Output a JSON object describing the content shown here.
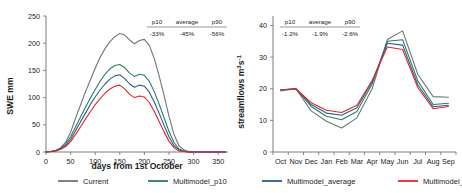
{
  "figure": {
    "background": "#ffffff",
    "colors": {
      "current": "#6b7a76",
      "p10": "#2e7d5b",
      "average": "#2a5d94",
      "p90": "#e8252a",
      "axis": "#6e6e6e",
      "text": "#1b1b1b"
    },
    "legend": {
      "items": [
        {
          "label": "Current",
          "color": "#6b7a76",
          "key": "current"
        },
        {
          "label": "Multimodel_p10",
          "color": "#2e7d5b",
          "key": "p10"
        },
        {
          "label": "Multimodel_average",
          "color": "#2a5d94",
          "key": "average"
        },
        {
          "label": "Multimodel_p90",
          "color": "#e8252a",
          "key": "p90"
        }
      ]
    }
  },
  "chart_data": [
    {
      "id": "swe",
      "type": "line",
      "title": "",
      "xlabel": "days from 1st October",
      "ylabel": "SWE mm",
      "xlim": [
        0,
        370
      ],
      "ylim": [
        0,
        250
      ],
      "xticks": [
        0,
        50,
        100,
        150,
        200,
        250,
        300,
        350
      ],
      "yticks": [
        0,
        50,
        100,
        150,
        200,
        250
      ],
      "grid": false,
      "legend_position": "below-figure",
      "annotation_table": {
        "headers": [
          "p10",
          "average",
          "p90"
        ],
        "values": [
          "-33%",
          "-45%",
          "-56%"
        ]
      },
      "x": [
        0,
        10,
        20,
        30,
        40,
        50,
        60,
        70,
        80,
        90,
        100,
        110,
        120,
        130,
        140,
        150,
        160,
        170,
        180,
        190,
        200,
        210,
        220,
        230,
        240,
        250,
        260,
        270,
        280,
        290,
        300,
        310,
        320,
        340,
        365
      ],
      "series": [
        {
          "name": "Current",
          "color": "#6b7a76",
          "values": [
            0,
            1,
            3,
            8,
            18,
            36,
            62,
            86,
            110,
            132,
            154,
            174,
            190,
            203,
            212,
            218,
            215,
            206,
            199,
            205,
            207,
            196,
            172,
            140,
            104,
            66,
            33,
            12,
            4,
            1,
            0,
            0,
            0,
            0,
            0
          ]
        },
        {
          "name": "Multimodel_p10",
          "color": "#2e7d5b",
          "values": [
            0,
            1,
            3,
            7,
            15,
            28,
            46,
            64,
            82,
            99,
            115,
            130,
            143,
            153,
            159,
            161,
            155,
            145,
            139,
            143,
            141,
            130,
            111,
            88,
            63,
            38,
            18,
            6,
            2,
            0,
            0,
            0,
            0,
            0,
            0
          ]
        },
        {
          "name": "Multimodel_average",
          "color": "#2a5d94",
          "values": [
            0,
            1,
            2,
            6,
            12,
            23,
            39,
            55,
            71,
            87,
            101,
            114,
            125,
            134,
            140,
            142,
            135,
            125,
            119,
            123,
            121,
            110,
            92,
            71,
            49,
            28,
            12,
            4,
            1,
            0,
            0,
            0,
            0,
            0,
            0
          ]
        },
        {
          "name": "Multimodel_p90",
          "color": "#e8252a",
          "values": [
            0,
            1,
            2,
            5,
            10,
            19,
            32,
            46,
            60,
            74,
            87,
            98,
            108,
            116,
            121,
            123,
            116,
            106,
            100,
            103,
            101,
            91,
            75,
            56,
            37,
            20,
            8,
            2,
            1,
            0,
            0,
            0,
            0,
            0,
            0
          ]
        }
      ]
    },
    {
      "id": "streamflows",
      "type": "line",
      "title": "",
      "xlabel": "",
      "ylabel": "streamflows  m3s-1",
      "ylabel_display": "streamflows  m³s⁻¹",
      "xlim": [
        0,
        12
      ],
      "ylim": [
        0,
        43
      ],
      "yticks": [
        0,
        10,
        20,
        30,
        40
      ],
      "grid": false,
      "legend_position": "below-figure",
      "annotation_table": {
        "headers": [
          "p10",
          "average",
          "p90"
        ],
        "values": [
          "-1.2%",
          "-1.9%",
          "-2.6%"
        ]
      },
      "categories": [
        "Oct",
        "Nov",
        "Dec",
        "Jan",
        "Feb",
        "Mar",
        "Apr",
        "May",
        "Jun",
        "Jul",
        "Aug",
        "Sep"
      ],
      "series": [
        {
          "name": "Current",
          "color": "#6b7a76",
          "values": [
            19.3,
            20.0,
            13.0,
            9.7,
            7.6,
            10.8,
            20.0,
            35.6,
            38.3,
            24.5,
            17.5,
            17.3
          ]
        },
        {
          "name": "Multimodel_p10",
          "color": "#2e7d5b",
          "values": [
            19.6,
            20.0,
            14.4,
            11.3,
            10.2,
            12.8,
            21.5,
            35.0,
            35.5,
            22.4,
            15.0,
            15.4
          ]
        },
        {
          "name": "Multimodel_average",
          "color": "#2a5d94",
          "values": [
            19.7,
            20.0,
            15.0,
            12.3,
            11.6,
            14.0,
            22.2,
            34.4,
            33.8,
            21.2,
            14.3,
            14.8
          ]
        },
        {
          "name": "Multimodel_p90",
          "color": "#e8252a",
          "values": [
            19.6,
            20.0,
            15.6,
            13.2,
            12.5,
            14.8,
            22.6,
            33.2,
            32.4,
            20.3,
            13.7,
            14.4
          ]
        }
      ]
    }
  ]
}
